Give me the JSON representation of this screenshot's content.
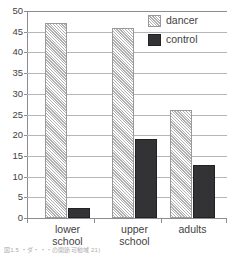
{
  "chart_data": {
    "type": "bar",
    "title": "",
    "subtitle": "",
    "xlabel": "",
    "ylabel": "",
    "categories": [
      "lower\nschool",
      "upper\nschool",
      "adults"
    ],
    "series": [
      {
        "name": "dancer",
        "values": [
          47,
          46,
          26
        ],
        "color": "#e3e3e3",
        "pattern": "diagonal-hatch"
      },
      {
        "name": "control",
        "values": [
          2.5,
          19,
          12.8
        ],
        "color": "#333335",
        "pattern": "solid"
      }
    ],
    "ylim": [
      0,
      50
    ],
    "ytick_labels": [
      "0",
      "5",
      "10",
      "15",
      "20",
      "25",
      "30",
      "35",
      "40",
      "45",
      "50"
    ],
    "ytick_values": [
      0,
      5,
      10,
      15,
      20,
      25,
      30,
      35,
      40,
      45,
      50
    ],
    "grid": "horizontal",
    "legend_position": "top-right",
    "legend_entries": [
      "dancer",
      "control"
    ]
  },
  "legend": {
    "items": [
      {
        "label": "dancer"
      },
      {
        "label": "control"
      }
    ]
  },
  "caption": {
    "text": "図1.5 ・ダ・・・の関節可動域 21)"
  }
}
